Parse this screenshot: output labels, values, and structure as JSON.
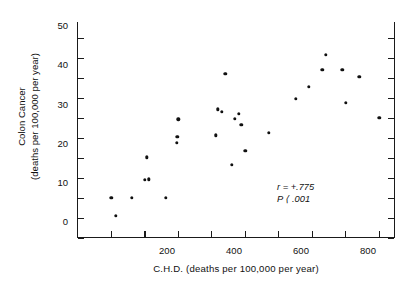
{
  "chart_data": {
    "type": "scatter",
    "title": "",
    "xlabel": "C.H.D. (deaths per 100,000 per year)",
    "ylabel_line1": "Colon Cancer",
    "ylabel_line2": "(deaths per 100,000 per year)",
    "xlim": [
      0,
      950
    ],
    "ylim": [
      0,
      54
    ],
    "xticks_major": [
      200,
      400,
      600,
      800
    ],
    "xticks_major_labels": [
      "200",
      "400",
      "600",
      "800"
    ],
    "xticks_minor": [
      100,
      300,
      500,
      700,
      900
    ],
    "yticks_major": [
      0,
      10,
      20,
      30,
      40,
      50
    ],
    "yticks_major_labels": [
      "0",
      "10",
      "20",
      "30",
      "40",
      "50"
    ],
    "yticks_minor": [
      5,
      15,
      25,
      35,
      45
    ],
    "grid": false,
    "legend": null,
    "annotations": [
      {
        "name": "correlation",
        "symbol": "r",
        "relation": "=",
        "value": "+.775",
        "text": "r = +.775"
      },
      {
        "name": "p-value",
        "symbol": "P",
        "relation": "⟨",
        "value": ".001",
        "text": "P ⟨ .001"
      }
    ],
    "points": [
      {
        "x": 100,
        "y": 10.0
      },
      {
        "x": 113,
        "y": 5.5
      },
      {
        "x": 160,
        "y": 10.0
      },
      {
        "x": 200,
        "y": 14.5
      },
      {
        "x": 212,
        "y": 14.7
      },
      {
        "x": 205,
        "y": 20.2
      },
      {
        "x": 262,
        "y": 10.0
      },
      {
        "x": 295,
        "y": 23.8
      },
      {
        "x": 297,
        "y": 25.3
      },
      {
        "x": 300,
        "y": 29.7
      },
      {
        "x": 412,
        "y": 25.7
      },
      {
        "x": 418,
        "y": 32.2
      },
      {
        "x": 430,
        "y": 31.5
      },
      {
        "x": 440,
        "y": 41.0
      },
      {
        "x": 460,
        "y": 18.3
      },
      {
        "x": 468,
        "y": 29.8
      },
      {
        "x": 480,
        "y": 31.0
      },
      {
        "x": 488,
        "y": 28.3
      },
      {
        "x": 500,
        "y": 21.8
      },
      {
        "x": 570,
        "y": 26.3
      },
      {
        "x": 650,
        "y": 34.8
      },
      {
        "x": 690,
        "y": 37.8
      },
      {
        "x": 730,
        "y": 42.0
      },
      {
        "x": 740,
        "y": 45.8
      },
      {
        "x": 790,
        "y": 42.0
      },
      {
        "x": 800,
        "y": 33.8
      },
      {
        "x": 840,
        "y": 40.3
      },
      {
        "x": 900,
        "y": 30.0
      }
    ]
  }
}
